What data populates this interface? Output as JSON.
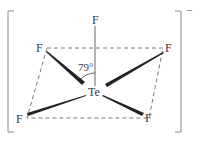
{
  "diagram": {
    "type": "molecular-structure",
    "species": "TeF5-",
    "central_atom": {
      "label": "Te",
      "x": 94,
      "y": 96
    },
    "atoms": [
      {
        "id": "F-axial",
        "label": "F",
        "x": 95,
        "y": 24
      },
      {
        "id": "F-upper-left",
        "label": "F",
        "x": 40,
        "y": 52
      },
      {
        "id": "F-upper-right",
        "label": "F",
        "x": 169,
        "y": 52
      },
      {
        "id": "F-lower-left",
        "label": "F",
        "x": 20,
        "y": 123
      },
      {
        "id": "F-lower-right",
        "label": "F",
        "x": 148,
        "y": 122
      }
    ],
    "angle_label": "79°",
    "charge": "−",
    "colors": {
      "ink": "#3a3a3a",
      "bracket": "#7a7a7a",
      "dash": "#555555",
      "background": "#ffffff"
    }
  }
}
